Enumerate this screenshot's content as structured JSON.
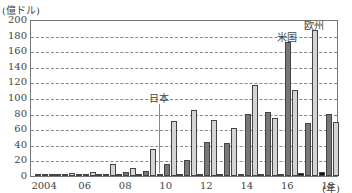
{
  "chart_data": {
    "type": "bar",
    "title": "",
    "unit_label": "(億ドル)",
    "xlabel": "(年)",
    "ylabel": "億ドル",
    "ylim": [
      0,
      200
    ],
    "yticks": [
      0,
      20,
      40,
      60,
      80,
      100,
      120,
      140,
      160,
      180,
      200
    ],
    "grid": true,
    "categories": [
      "2004",
      "2005",
      "2006",
      "2007",
      "2008",
      "2009",
      "2010",
      "2011",
      "2012",
      "2013",
      "2014",
      "2015",
      "2016",
      "2017",
      "2018"
    ],
    "xtick_labels": [
      {
        "year": "2004",
        "label": "2004"
      },
      {
        "year": "2006",
        "label": "06"
      },
      {
        "year": "2008",
        "label": "08"
      },
      {
        "year": "2010",
        "label": "10"
      },
      {
        "year": "2012",
        "label": "12"
      },
      {
        "year": "2014",
        "label": "14"
      },
      {
        "year": "2016",
        "label": "16"
      },
      {
        "year": "2018",
        "label": "18"
      }
    ],
    "series": [
      {
        "name": "日本",
        "color": "#111111",
        "values": [
          0,
          0,
          0,
          0,
          0,
          0,
          3,
          1,
          2,
          3,
          3,
          2,
          3,
          4,
          5
        ]
      },
      {
        "name": "米国",
        "color": "#777777",
        "values": [
          1,
          2,
          2,
          2,
          5,
          7,
          15,
          20,
          44,
          42,
          79,
          82,
          172,
          68,
          79
        ]
      },
      {
        "name": "欧州",
        "color": "#d4d4d4",
        "values": [
          1,
          4,
          5,
          15,
          10,
          34,
          70,
          85,
          72,
          62,
          117,
          74,
          110,
          187,
          69
        ]
      }
    ],
    "annotations": [
      {
        "text": "日本",
        "series": "日本",
        "near_year": "2010"
      },
      {
        "text": "米国",
        "series": "米国",
        "near_year": "2016"
      },
      {
        "text": "欧州",
        "series": "欧州",
        "near_year": "2017"
      }
    ],
    "legend_position": "inline annotations"
  }
}
